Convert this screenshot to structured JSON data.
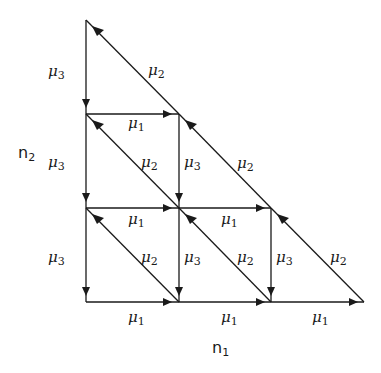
{
  "diagram": {
    "axis_labels": {
      "n1": {
        "base": "n",
        "sub": "1"
      },
      "n2": {
        "base": "n",
        "sub": "2"
      }
    },
    "rates": {
      "mu1": {
        "base": "μ",
        "sub": "1"
      },
      "mu2": {
        "base": "μ",
        "sub": "2"
      },
      "mu3": {
        "base": "μ",
        "sub": "3"
      }
    },
    "edge_labels": [
      {
        "id": "l1",
        "rate": "mu3",
        "x": 48,
        "y": 64
      },
      {
        "id": "l2",
        "rate": "mu2",
        "x": 148,
        "y": 63
      },
      {
        "id": "l3",
        "rate": "mu1",
        "x": 128,
        "y": 116
      },
      {
        "id": "l4",
        "rate": "mu3",
        "x": 48,
        "y": 155
      },
      {
        "id": "l5",
        "rate": "mu2",
        "x": 141,
        "y": 155
      },
      {
        "id": "l6",
        "rate": "mu3",
        "x": 184,
        "y": 155
      },
      {
        "id": "l7",
        "rate": "mu2",
        "x": 237,
        "y": 156
      },
      {
        "id": "l8",
        "rate": "mu1",
        "x": 128,
        "y": 212
      },
      {
        "id": "l9",
        "rate": "mu1",
        "x": 221,
        "y": 212
      },
      {
        "id": "l10",
        "rate": "mu3",
        "x": 48,
        "y": 250
      },
      {
        "id": "l11",
        "rate": "mu2",
        "x": 141,
        "y": 250
      },
      {
        "id": "l12",
        "rate": "mu3",
        "x": 184,
        "y": 250
      },
      {
        "id": "l13",
        "rate": "mu2",
        "x": 237,
        "y": 250
      },
      {
        "id": "l14",
        "rate": "mu3",
        "x": 276,
        "y": 250
      },
      {
        "id": "l15",
        "rate": "mu2",
        "x": 330,
        "y": 250
      },
      {
        "id": "l16",
        "rate": "mu1",
        "x": 128,
        "y": 310
      },
      {
        "id": "l17",
        "rate": "mu1",
        "x": 221,
        "y": 310
      },
      {
        "id": "l18",
        "rate": "mu1",
        "x": 312,
        "y": 310
      }
    ],
    "nodes": [
      [
        86,
        20
      ],
      [
        86,
        114
      ],
      [
        179,
        114
      ],
      [
        86,
        208
      ],
      [
        179,
        208
      ],
      [
        271,
        208
      ],
      [
        86,
        302
      ],
      [
        179,
        302
      ],
      [
        271,
        302
      ],
      [
        364,
        302
      ]
    ]
  }
}
